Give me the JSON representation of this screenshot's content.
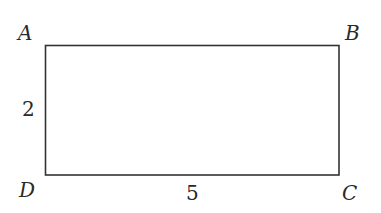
{
  "diagram": {
    "type": "rectangle",
    "stroke_color": "#333333",
    "fill_color": "#ffffff",
    "vertices": {
      "top_left": "A",
      "top_right": "B",
      "bottom_right": "C",
      "bottom_left": "D"
    },
    "side_labels": {
      "AD": "2",
      "DC": "5"
    }
  }
}
